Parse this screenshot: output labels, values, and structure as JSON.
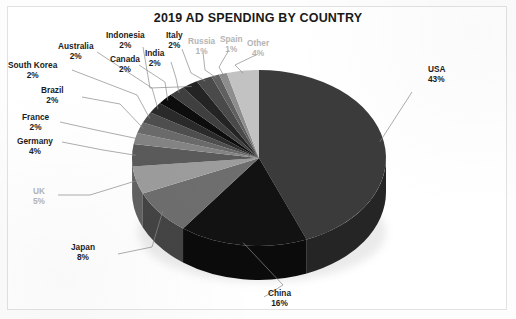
{
  "document": {
    "title": "2019 AD SPENDING BY COUNTRY"
  },
  "chart_data": {
    "type": "pie",
    "title": "2019 AD SPENDING BY COUNTRY",
    "xlabel": "",
    "ylabel": "",
    "units": "percent",
    "three_d": true,
    "legend": "none",
    "data_labels": "category name and percentage, outside slices with leader lines",
    "start_angle_deg": 0,
    "direction": "clockwise",
    "categories": [
      "USA",
      "China",
      "Japan",
      "UK",
      "Germany",
      "France",
      "Brazil",
      "South Korea",
      "Australia",
      "Canada",
      "India",
      "Indonesia",
      "Italy",
      "Russia",
      "Spain",
      "Other"
    ],
    "values": [
      43,
      16,
      8,
      5,
      4,
      2,
      2,
      2,
      2,
      2,
      2,
      2,
      2,
      1,
      1,
      4
    ],
    "labels": [
      {
        "name": "USA",
        "pct": "43%",
        "value": 43,
        "color": "#3b3b3b"
      },
      {
        "name": "China",
        "pct": "16%",
        "value": 16,
        "color": "#121212"
      },
      {
        "name": "Japan",
        "pct": "8%",
        "value": 8,
        "color": "#6e6e6e"
      },
      {
        "name": "UK",
        "pct": "5%",
        "value": 5,
        "color": "#9c9c9c"
      },
      {
        "name": "Germany",
        "pct": "4%",
        "value": 4,
        "color": "#5a5a5a"
      },
      {
        "name": "France",
        "pct": "2%",
        "value": 2,
        "color": "#838383"
      },
      {
        "name": "Brazil",
        "pct": "2%",
        "value": 2,
        "color": "#6a6a6a"
      },
      {
        "name": "South Korea",
        "pct": "2%",
        "value": 2,
        "color": "#4e4e4e"
      },
      {
        "name": "Australia",
        "pct": "2%",
        "value": 2,
        "color": "#2a2a2a"
      },
      {
        "name": "Canada",
        "pct": "2%",
        "value": 2,
        "color": "#0d0d0d"
      },
      {
        "name": "India",
        "pct": "2%",
        "value": 2,
        "color": "#3f3f3f"
      },
      {
        "name": "Indonesia",
        "pct": "2%",
        "value": 2,
        "color": "#242424"
      },
      {
        "name": "Italy",
        "pct": "2%",
        "value": 2,
        "color": "#4a4a4a"
      },
      {
        "name": "Russia",
        "pct": "1%",
        "value": 1,
        "color": "#606060"
      },
      {
        "name": "Spain",
        "pct": "1%",
        "value": 1,
        "color": "#8d8d8d"
      },
      {
        "name": "Other",
        "pct": "4%",
        "value": 4,
        "color": "#c2c2c2"
      }
    ]
  },
  "colors": {
    "background": "#ffffff",
    "title_text": "#191919",
    "label_text": "#1c1c1c",
    "faded_label_text": "#b4b4b4",
    "leader_line": "#8a8a8a",
    "page_border": "#e2e2e2"
  }
}
